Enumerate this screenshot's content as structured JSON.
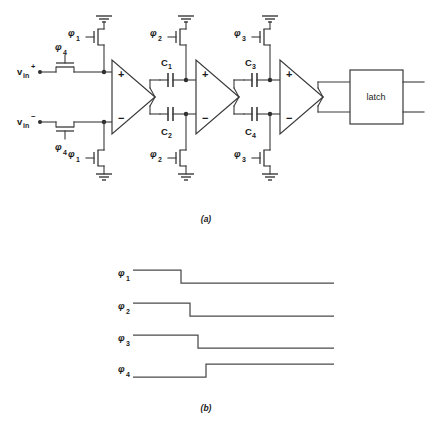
{
  "figure": {
    "title_a": "(a)",
    "title_b": "(b)",
    "background": "#ffffff",
    "line_color": "#3a3a3a"
  },
  "schematic": {
    "inputs": [
      {
        "name": "vin-plus",
        "base": "v",
        "sub": "in",
        "sup": "+"
      },
      {
        "name": "vin-minus",
        "base": "v",
        "sub": "in",
        "sup": "−"
      }
    ],
    "clock_labels": [
      {
        "id": "phi1-top",
        "glyph": "φ",
        "sub": "1"
      },
      {
        "id": "phi1-bottom",
        "glyph": "φ",
        "sub": "1"
      },
      {
        "id": "phi4-top",
        "glyph": "φ",
        "sub": "4"
      },
      {
        "id": "phi4-bottom",
        "glyph": "φ",
        "sub": "4"
      },
      {
        "id": "phi2-top",
        "glyph": "φ",
        "sub": "2"
      },
      {
        "id": "phi2-bottom",
        "glyph": "φ",
        "sub": "2"
      },
      {
        "id": "phi3-top",
        "glyph": "φ",
        "sub": "3"
      },
      {
        "id": "phi3-bottom",
        "glyph": "φ",
        "sub": "3"
      }
    ],
    "capacitors": [
      {
        "id": "C1",
        "base": "C",
        "sub": "1"
      },
      {
        "id": "C2",
        "base": "C",
        "sub": "2"
      },
      {
        "id": "C3",
        "base": "C",
        "sub": "3"
      },
      {
        "id": "C4",
        "base": "C",
        "sub": "4"
      }
    ],
    "amplifiers": [
      {
        "id": "amp1",
        "plus": "+",
        "minus": "−"
      },
      {
        "id": "amp2",
        "plus": "+",
        "minus": "−"
      },
      {
        "id": "amp3",
        "plus": "+",
        "minus": "−"
      }
    ],
    "latch": {
      "label": "latch"
    }
  },
  "timing": {
    "signals": [
      {
        "id": "phi1",
        "glyph": "φ",
        "sub": "1",
        "type": "falling",
        "edge_x": 181,
        "high_y": 270,
        "low_y": 283
      },
      {
        "id": "phi2",
        "glyph": "φ",
        "sub": "2",
        "type": "falling",
        "edge_x": 190,
        "high_y": 303,
        "low_y": 316
      },
      {
        "id": "phi3",
        "glyph": "φ",
        "sub": "3",
        "type": "falling",
        "edge_x": 198,
        "high_y": 335,
        "low_y": 348
      },
      {
        "id": "phi4",
        "glyph": "φ",
        "sub": "4",
        "type": "rising",
        "edge_x": 206,
        "high_y": 364,
        "low_y": 377
      }
    ],
    "start_x": 133,
    "end_x": 334
  }
}
